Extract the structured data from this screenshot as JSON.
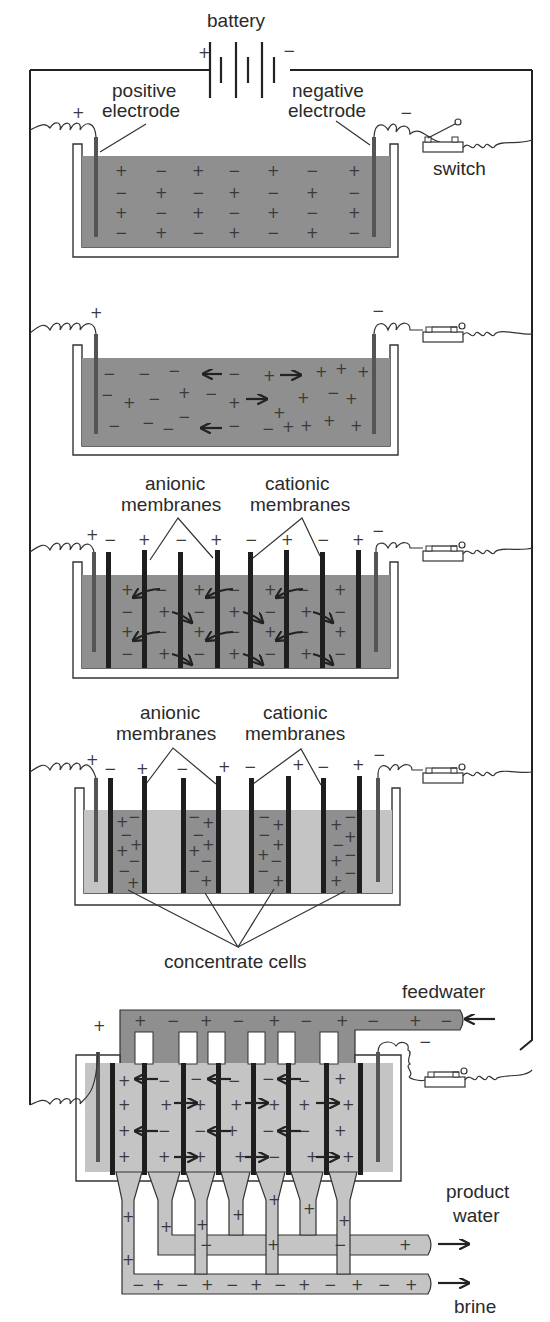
{
  "colors": {
    "dark_solution": "#8f8f8f",
    "light_solution": "#c4c4c4",
    "membrane": "#1e1e1e",
    "line": "#222222"
  },
  "labels": {
    "battery": "battery",
    "battery_plus": "+",
    "battery_minus": "−",
    "positive_electrode_1": "positive",
    "positive_electrode_2": "electrode",
    "negative_electrode_1": "negative",
    "negative_electrode_2": "electrode",
    "switch": "switch",
    "anionic_1": "anionic",
    "anionic_2": "membranes",
    "cationic_1": "cationic",
    "cationic_2": "membranes",
    "concentrate_cells": "concentrate cells",
    "feedwater": "feedwater",
    "product_water_1": "product",
    "product_water_2": "water",
    "brine": "brine",
    "plus": "+",
    "minus": "−"
  },
  "panels": [
    {
      "id": 1,
      "description": "Electrodes in salt solution, switch open"
    },
    {
      "id": 2,
      "description": "Switch closed, ions migrate to electrodes"
    },
    {
      "id": 3,
      "description": "Anionic and cationic membranes inserted"
    },
    {
      "id": 4,
      "description": "Concentrate cells form between membranes"
    },
    {
      "id": 5,
      "description": "Continuous flow electrodialysis stack with feedwater, product water and brine"
    }
  ]
}
